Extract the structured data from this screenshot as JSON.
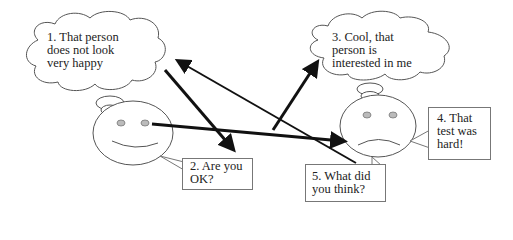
{
  "diagram": {
    "thoughts": [
      {
        "id": "thought-1",
        "text": "1.  That person\ndoes not look\nvery happy"
      },
      {
        "id": "thought-3",
        "text": "3. Cool, that\nperson is\ninterested in me"
      }
    ],
    "speech": [
      {
        "id": "speech-2",
        "text": "2. Are you\nOK?"
      },
      {
        "id": "speech-4",
        "text": "4. That\ntest was\nhard!"
      },
      {
        "id": "speech-5",
        "text": "5. What did\nyou think?"
      }
    ],
    "faces": [
      {
        "id": "face-left",
        "expression": "smile"
      },
      {
        "id": "face-right",
        "expression": "frown"
      }
    ],
    "colors": {
      "stroke": "#555555",
      "arrow": "#111111",
      "eye": "#bbbbbb"
    }
  }
}
